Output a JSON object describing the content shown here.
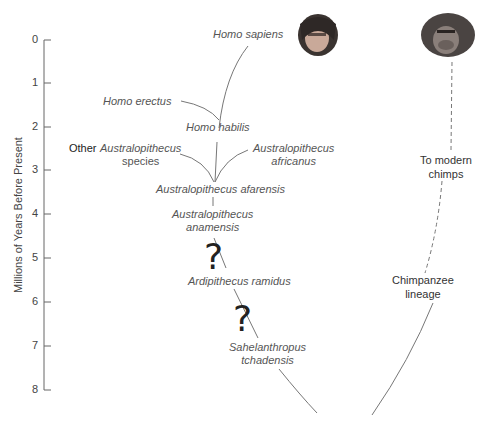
{
  "axis": {
    "title": "Millions of Years Before Present",
    "ticks": [
      "0",
      "1",
      "2",
      "3",
      "4",
      "5",
      "6",
      "7",
      "8"
    ]
  },
  "human_lineage": {
    "homo_sapiens": "Homo sapiens",
    "homo_erectus": "Homo erectus",
    "homo_habilis": "Homo habilis",
    "other_prefix": "Other",
    "other_austral_1": "Australopithecus",
    "other_austral_2": "species",
    "africanus_1": "Australopithecus",
    "africanus_2": "africanus",
    "afarensis": "Australopithecus afarensis",
    "anamensis_1": "Australopithecus",
    "anamensis_2": "anamensis",
    "ardipithecus": "Ardipithecus ramidus",
    "sahelanthropus_1": "Sahelanthropus",
    "sahelanthropus_2": "tchadensis",
    "uncertainty_mark": "?"
  },
  "chimp_lineage": {
    "to_modern_1": "To modern",
    "to_modern_2": "chimps",
    "lineage_1": "Chimpanzee",
    "lineage_2": "lineage"
  },
  "icons": {
    "human_head": "homo-sapiens-head-illustration",
    "chimp_head": "chimpanzee-head-illustration"
  },
  "colors": {
    "line": "#777777",
    "text": "#555555",
    "axis": "#666666"
  }
}
